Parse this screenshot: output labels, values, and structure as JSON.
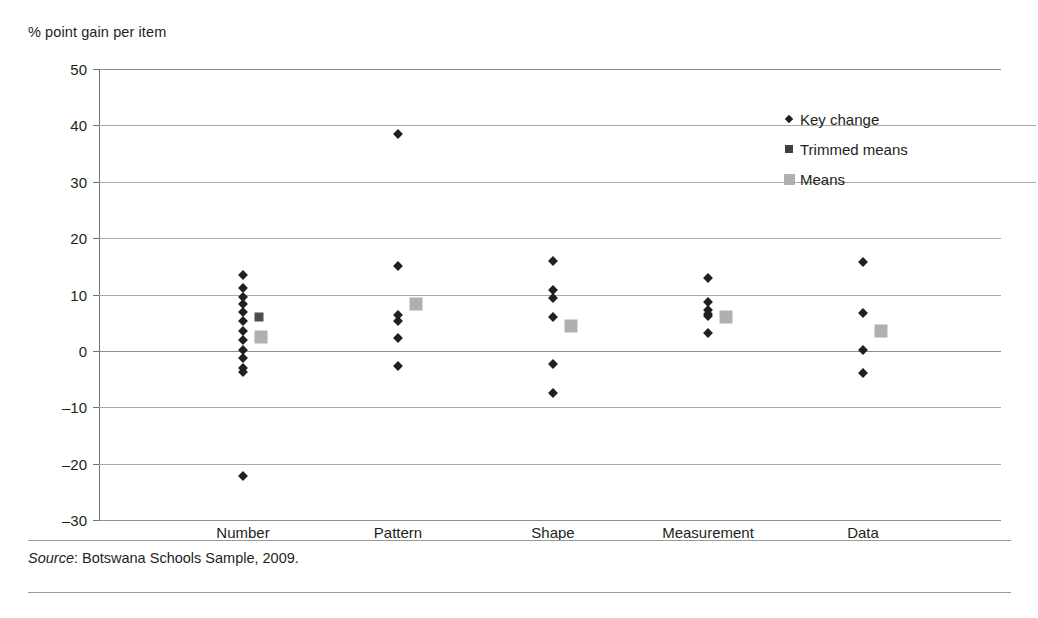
{
  "chart_data": {
    "type": "scatter",
    "title": "",
    "xlabel": "",
    "ylabel": "% point gain per item",
    "ylim": [
      -30,
      50
    ],
    "yticks": [
      50,
      40,
      30,
      20,
      10,
      0,
      -10,
      -20,
      -30
    ],
    "ytick_labels": [
      "50",
      "40",
      "30",
      "20",
      "10",
      "0",
      "–10",
      "–20",
      "–30"
    ],
    "grid": true,
    "legend_position": "top-right",
    "categories": [
      "Number",
      "Pattern",
      "Shape",
      "Measurement",
      "Data"
    ],
    "legend": [
      {
        "label": "Key change",
        "marker": "diamond",
        "color": "#231f20"
      },
      {
        "label": "Trimmed means",
        "marker": "square",
        "color": "#3f3f3f"
      },
      {
        "label": "Means",
        "marker": "square",
        "color": "#b0b0b0"
      }
    ],
    "series": [
      {
        "name": "Key change",
        "marker": "diamond",
        "points_by_category": {
          "Number": [
            13.5,
            11.2,
            9.5,
            8.4,
            6.9,
            5.3,
            3.6,
            2.0,
            0.2,
            -1.2,
            -3.0,
            -3.8,
            -22.2
          ],
          "Pattern": [
            38.5,
            15.0,
            6.4,
            5.3,
            2.3,
            -2.6
          ],
          "Shape": [
            16.0,
            10.8,
            9.4,
            6.0,
            -2.3,
            -7.5
          ],
          "Measurement": [
            13.0,
            8.7,
            7.3,
            6.6,
            6.2,
            3.2
          ],
          "Data": [
            15.8,
            6.7,
            0.2,
            -3.9
          ]
        }
      },
      {
        "name": "Trimmed means",
        "marker": "square-dark",
        "points_by_category": {
          "Number": [
            4.8
          ],
          "Pattern": [],
          "Shape": [],
          "Measurement": [],
          "Data": []
        }
      },
      {
        "name": "Means",
        "marker": "square-gray",
        "points_by_category": {
          "Number": [
            3.6
          ],
          "Pattern": [
            9.4
          ],
          "Shape": [
            5.4
          ],
          "Measurement": [
            7.0
          ],
          "Data": [
            4.6
          ]
        }
      }
    ]
  },
  "source": {
    "prefix": "Source",
    "text": ": Botswana Schools Sample, 2009."
  }
}
